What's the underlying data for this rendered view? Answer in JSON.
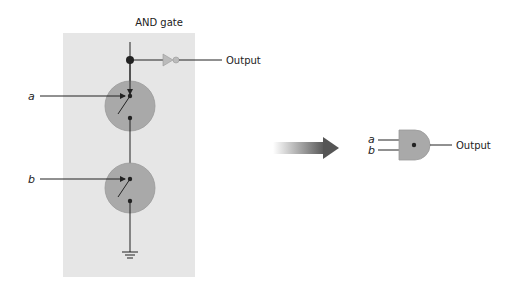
{
  "title": "AND gate",
  "transistor_circuit": {
    "inputs": [
      {
        "label": "a"
      },
      {
        "label": "b"
      }
    ],
    "output_label": "Output"
  },
  "gate_symbol": {
    "inputs": [
      {
        "label": "a"
      },
      {
        "label": "b"
      }
    ],
    "output_label": "Output"
  },
  "colors": {
    "panel": "#e6e6e6",
    "transistor": "#a9a9a9",
    "gate": "#a9a9a9",
    "line": "#222222"
  }
}
